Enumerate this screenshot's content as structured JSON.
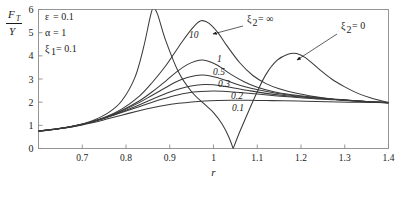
{
  "chart_data": {
    "type": "line",
    "title": "",
    "xlabel": "r",
    "ylabel": "F_T / Y",
    "ylabel_numerator": "F",
    "ylabel_numerator_sub": "T",
    "ylabel_denominator": "Y",
    "xlim": [
      0.6,
      1.4
    ],
    "ylim": [
      0,
      6
    ],
    "xticks": [
      0.7,
      0.8,
      0.9,
      1.0,
      1.1,
      1.2,
      1.3,
      1.4
    ],
    "xtick_labels": [
      "0.7",
      "0.8",
      "0.9",
      "1",
      "1.1",
      "1.2",
      "1.3",
      "1.4"
    ],
    "yticks": [
      0,
      1,
      2,
      3,
      4,
      5,
      6
    ],
    "ytick_labels": [
      "0",
      "1",
      "2",
      "3",
      "4",
      "5",
      "6"
    ],
    "grid": false,
    "legend_position": "inline-curve-labels",
    "curve_color": "#3a3a3a",
    "frame_color": "#8a8a8a",
    "parameters": [
      {
        "symbol": "ε",
        "eq": "=",
        "value": "0.1",
        "text": "ε = 0.1"
      },
      {
        "symbol": "α",
        "eq": "=",
        "value": "1",
        "text": "α = 1"
      },
      {
        "symbol": "ξ",
        "sub": "1",
        "eq": "=",
        "value": "0.1",
        "text": "ξ₁ = 0.1"
      }
    ],
    "annotations": [
      {
        "name": "xi2-infinity",
        "text": "ξ₂ = ∞",
        "symbol": "ξ",
        "sub": "2",
        "value": "∞",
        "x": 247,
        "y": 22,
        "arrow_from": [
          243,
          26
        ],
        "arrow_to": [
          213,
          34
        ]
      },
      {
        "name": "xi2-zero",
        "text": "ξ₂ = 0",
        "symbol": "ξ",
        "sub": "2",
        "value": "0",
        "x": 341,
        "y": 29,
        "arrow_from": [
          337,
          34
        ],
        "arrow_to": [
          297,
          60
        ]
      }
    ],
    "curve_labels": [
      {
        "label": "10",
        "x": 189,
        "y": 38
      },
      {
        "label": "1",
        "x": 217,
        "y": 62
      },
      {
        "label": "0.5",
        "x": 213,
        "y": 75
      },
      {
        "label": "0.3",
        "x": 218,
        "y": 87
      },
      {
        "label": "0.2",
        "x": 231,
        "y": 99
      },
      {
        "label": "0.1",
        "x": 232,
        "y": 111
      }
    ],
    "series": [
      {
        "name": "xi2 = 0",
        "label": "ξ₂ = 0",
        "peak1": {
          "r": 0.86,
          "value": 6.05
        },
        "notch": {
          "r": 1.045,
          "value": 0.0
        },
        "peak2": {
          "r": 1.19,
          "value": 4.1
        },
        "points": [
          [
            0.6,
            0.74
          ],
          [
            0.64,
            0.83
          ],
          [
            0.68,
            0.97
          ],
          [
            0.72,
            1.18
          ],
          [
            0.76,
            1.55
          ],
          [
            0.79,
            2.05
          ],
          [
            0.82,
            3.05
          ],
          [
            0.84,
            4.35
          ],
          [
            0.855,
            5.65
          ],
          [
            0.862,
            6.05
          ],
          [
            0.872,
            5.8
          ],
          [
            0.89,
            4.7
          ],
          [
            0.92,
            3.3
          ],
          [
            0.95,
            2.45
          ],
          [
            0.98,
            1.9
          ],
          [
            1.0,
            1.55
          ],
          [
            1.02,
            1.05
          ],
          [
            1.035,
            0.5
          ],
          [
            1.045,
            0.0
          ],
          [
            1.06,
            0.72
          ],
          [
            1.08,
            1.6
          ],
          [
            1.1,
            2.45
          ],
          [
            1.12,
            3.2
          ],
          [
            1.145,
            3.8
          ],
          [
            1.17,
            4.07
          ],
          [
            1.19,
            4.1
          ],
          [
            1.21,
            3.92
          ],
          [
            1.24,
            3.45
          ],
          [
            1.27,
            3.0
          ],
          [
            1.3,
            2.66
          ],
          [
            1.33,
            2.38
          ],
          [
            1.36,
            2.18
          ],
          [
            1.4,
            1.98
          ]
        ]
      },
      {
        "name": "xi2 = 10",
        "label": "10",
        "points": [
          [
            0.6,
            0.75
          ],
          [
            0.65,
            0.86
          ],
          [
            0.7,
            1.04
          ],
          [
            0.75,
            1.34
          ],
          [
            0.79,
            1.7
          ],
          [
            0.83,
            2.25
          ],
          [
            0.86,
            2.85
          ],
          [
            0.89,
            3.55
          ],
          [
            0.91,
            4.1
          ],
          [
            0.93,
            4.65
          ],
          [
            0.95,
            5.15
          ],
          [
            0.965,
            5.45
          ],
          [
            0.975,
            5.52
          ],
          [
            0.99,
            5.4
          ],
          [
            1.01,
            5.0
          ],
          [
            1.03,
            4.45
          ],
          [
            1.06,
            3.7
          ],
          [
            1.09,
            3.15
          ],
          [
            1.12,
            2.8
          ],
          [
            1.15,
            2.58
          ],
          [
            1.19,
            2.38
          ],
          [
            1.23,
            2.24
          ],
          [
            1.27,
            2.14
          ],
          [
            1.31,
            2.07
          ],
          [
            1.35,
            2.02
          ],
          [
            1.4,
            1.97
          ]
        ]
      },
      {
        "name": "xi2 = 1",
        "label": "1",
        "points": [
          [
            0.6,
            0.75
          ],
          [
            0.65,
            0.86
          ],
          [
            0.7,
            1.04
          ],
          [
            0.75,
            1.32
          ],
          [
            0.79,
            1.64
          ],
          [
            0.83,
            2.05
          ],
          [
            0.86,
            2.45
          ],
          [
            0.89,
            2.9
          ],
          [
            0.915,
            3.3
          ],
          [
            0.94,
            3.62
          ],
          [
            0.96,
            3.78
          ],
          [
            0.975,
            3.82
          ],
          [
            0.99,
            3.76
          ],
          [
            1.01,
            3.58
          ],
          [
            1.04,
            3.2
          ],
          [
            1.07,
            2.88
          ],
          [
            1.1,
            2.64
          ],
          [
            1.14,
            2.44
          ],
          [
            1.18,
            2.32
          ],
          [
            1.22,
            2.23
          ],
          [
            1.26,
            2.16
          ],
          [
            1.3,
            2.1
          ],
          [
            1.35,
            2.03
          ],
          [
            1.4,
            1.98
          ]
        ]
      },
      {
        "name": "xi2 = 0.5",
        "label": "0.5",
        "points": [
          [
            0.6,
            0.75
          ],
          [
            0.65,
            0.87
          ],
          [
            0.7,
            1.05
          ],
          [
            0.75,
            1.32
          ],
          [
            0.79,
            1.62
          ],
          [
            0.83,
            1.98
          ],
          [
            0.86,
            2.3
          ],
          [
            0.89,
            2.62
          ],
          [
            0.915,
            2.88
          ],
          [
            0.94,
            3.06
          ],
          [
            0.96,
            3.15
          ],
          [
            0.975,
            3.17
          ],
          [
            0.99,
            3.14
          ],
          [
            1.01,
            3.05
          ],
          [
            1.04,
            2.86
          ],
          [
            1.07,
            2.68
          ],
          [
            1.11,
            2.5
          ],
          [
            1.15,
            2.36
          ],
          [
            1.19,
            2.27
          ],
          [
            1.23,
            2.19
          ],
          [
            1.27,
            2.13
          ],
          [
            1.32,
            2.06
          ],
          [
            1.36,
            2.02
          ],
          [
            1.4,
            1.98
          ]
        ]
      },
      {
        "name": "xi2 = 0.3",
        "label": "0.3",
        "points": [
          [
            0.6,
            0.75
          ],
          [
            0.65,
            0.87
          ],
          [
            0.7,
            1.05
          ],
          [
            0.75,
            1.31
          ],
          [
            0.79,
            1.58
          ],
          [
            0.83,
            1.88
          ],
          [
            0.86,
            2.13
          ],
          [
            0.89,
            2.36
          ],
          [
            0.915,
            2.54
          ],
          [
            0.94,
            2.67
          ],
          [
            0.96,
            2.73
          ],
          [
            0.98,
            2.76
          ],
          [
            1.0,
            2.75
          ],
          [
            1.02,
            2.7
          ],
          [
            1.05,
            2.6
          ],
          [
            1.08,
            2.5
          ],
          [
            1.12,
            2.38
          ],
          [
            1.16,
            2.29
          ],
          [
            1.2,
            2.22
          ],
          [
            1.25,
            2.15
          ],
          [
            1.3,
            2.09
          ],
          [
            1.35,
            2.03
          ],
          [
            1.4,
            1.98
          ]
        ]
      },
      {
        "name": "xi2 = 0.2",
        "label": "0.2",
        "points": [
          [
            0.6,
            0.75
          ],
          [
            0.65,
            0.87
          ],
          [
            0.7,
            1.05
          ],
          [
            0.75,
            1.3
          ],
          [
            0.79,
            1.55
          ],
          [
            0.83,
            1.8
          ],
          [
            0.86,
            2.0
          ],
          [
            0.89,
            2.17
          ],
          [
            0.915,
            2.3
          ],
          [
            0.94,
            2.4
          ],
          [
            0.97,
            2.46
          ],
          [
            1.0,
            2.48
          ],
          [
            1.03,
            2.46
          ],
          [
            1.06,
            2.42
          ],
          [
            1.1,
            2.35
          ],
          [
            1.14,
            2.28
          ],
          [
            1.18,
            2.22
          ],
          [
            1.23,
            2.15
          ],
          [
            1.28,
            2.1
          ],
          [
            1.33,
            2.04
          ],
          [
            1.4,
            1.98
          ]
        ]
      },
      {
        "name": "xi2 = 0.1",
        "label": "0.1",
        "points": [
          [
            0.6,
            0.75
          ],
          [
            0.65,
            0.86
          ],
          [
            0.7,
            1.02
          ],
          [
            0.75,
            1.24
          ],
          [
            0.79,
            1.44
          ],
          [
            0.83,
            1.63
          ],
          [
            0.86,
            1.76
          ],
          [
            0.89,
            1.87
          ],
          [
            0.92,
            1.95
          ],
          [
            0.95,
            2.01
          ],
          [
            0.98,
            2.05
          ],
          [
            1.01,
            2.07
          ],
          [
            1.04,
            2.08
          ],
          [
            1.08,
            2.08
          ],
          [
            1.12,
            2.07
          ],
          [
            1.16,
            2.06
          ],
          [
            1.21,
            2.04
          ],
          [
            1.26,
            2.02
          ],
          [
            1.31,
            2.0
          ],
          [
            1.36,
            1.99
          ],
          [
            1.4,
            1.98
          ]
        ]
      }
    ]
  }
}
